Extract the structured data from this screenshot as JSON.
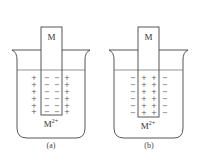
{
  "panels": [
    {
      "id": "a",
      "caption": "(a)",
      "electrode_label": "M",
      "ion_label": "M",
      "ion_charge": "2+",
      "electrode_surface_charge": "−",
      "solution_charge": "+"
    },
    {
      "id": "b",
      "caption": "(b)",
      "electrode_label": "M",
      "ion_label": "M",
      "ion_charge": "2+",
      "electrode_surface_charge": "+",
      "solution_charge": "−"
    }
  ]
}
